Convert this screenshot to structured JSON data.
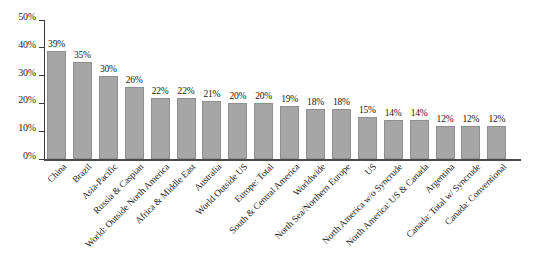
{
  "chart_data": {
    "type": "bar",
    "title": "",
    "subtitle": "",
    "xlabel": "",
    "ylabel": "",
    "ylim": [
      0,
      50
    ],
    "ytick_values": [
      0,
      10,
      20,
      30,
      40,
      50
    ],
    "ytick_labels": [
      "0%",
      "10%",
      "20%",
      "30%",
      "40%",
      "50%"
    ],
    "grid": false,
    "legend": null,
    "bar_color": "#a6a6a6",
    "bar_edge_color": "#8f8f8f",
    "value_label_suffix": "%",
    "categories": [
      "China",
      "Brazil",
      "Asia-Pacific",
      "Russia & Caspian",
      "World: Outside North America",
      "Africa & Middle East",
      "Australia",
      "World Outside US",
      "Europe: Total",
      "South & Central America",
      "Worldwide",
      "North Sea/Northern Europe",
      "US",
      "North America w/o Syncrude",
      "North America: US & Canada",
      "Argentina",
      "Canada: Total w/ Syncrude",
      "Canada: Conventional"
    ],
    "values": [
      39,
      35,
      30,
      26,
      22,
      22,
      21,
      20,
      20,
      19,
      18,
      18,
      15,
      14,
      14,
      12,
      12,
      12
    ],
    "value_labels": [
      "39%",
      "35%",
      "30%",
      "26%",
      "22%",
      "22%",
      "21%",
      "20%",
      "20%",
      "19%",
      "18%",
      "18%",
      "15%",
      "14%",
      "14%",
      "12%",
      "12%",
      "12%"
    ]
  }
}
